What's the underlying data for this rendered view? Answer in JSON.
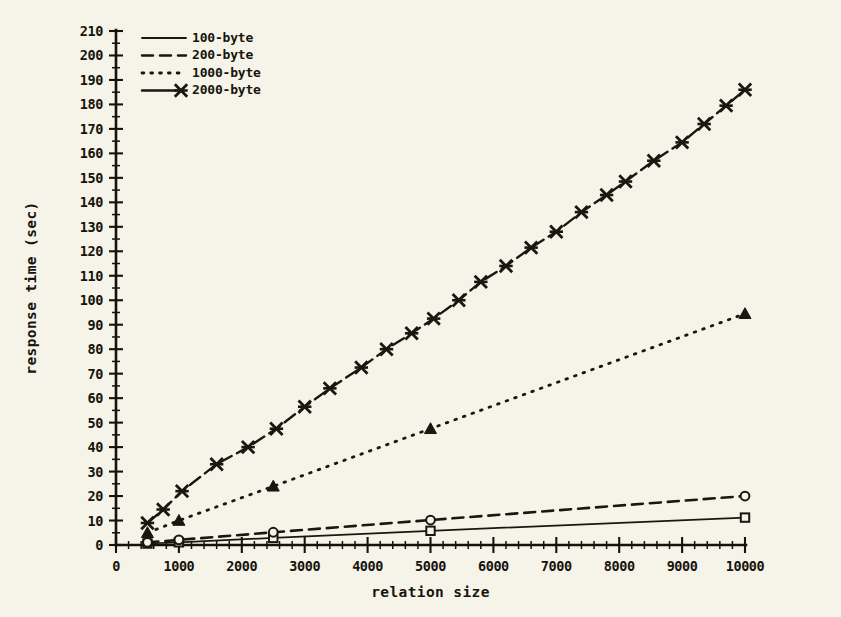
{
  "chart_data": {
    "type": "line",
    "title": "",
    "xlabel": "relation size",
    "ylabel": "response time (sec)",
    "xlim": [
      0,
      10000
    ],
    "ylim": [
      0,
      210
    ],
    "xticks": [
      0,
      1000,
      2000,
      3000,
      4000,
      5000,
      6000,
      7000,
      8000,
      9000,
      10000
    ],
    "yticks": [
      0,
      10,
      20,
      30,
      40,
      50,
      60,
      70,
      80,
      90,
      100,
      110,
      120,
      130,
      140,
      150,
      160,
      170,
      180,
      190,
      200,
      210
    ],
    "xtick_labels": [
      "0",
      "1000",
      "2000",
      "3000",
      "4000",
      "5000",
      "6000",
      "7000",
      "8000",
      "9000",
      "10000"
    ],
    "ytick_labels": [
      "0",
      "10",
      "20",
      "30",
      "40",
      "50",
      "60",
      "70",
      "80",
      "90",
      "100",
      "110",
      "120",
      "130",
      "140",
      "150",
      "160",
      "170",
      "180",
      "190",
      "200",
      "210"
    ],
    "grid": false,
    "legend_position": "top-left",
    "series": [
      {
        "name": "100-byte",
        "label": "100-byte",
        "linestyle": "solid",
        "marker": "square-open",
        "color": "#1a1710",
        "x": [
          500,
          1000,
          2500,
          5000,
          10000
        ],
        "values": [
          0.6,
          1.1,
          2.9,
          5.8,
          11.2
        ]
      },
      {
        "name": "200-byte",
        "label": "200-byte",
        "linestyle": "dashed",
        "marker": "circle-open",
        "color": "#1a1710",
        "x": [
          500,
          1000,
          2500,
          5000,
          10000
        ],
        "values": [
          1.1,
          2.1,
          5.2,
          10.2,
          20.0
        ]
      },
      {
        "name": "1000-byte",
        "label": "1000-byte",
        "linestyle": "dotted",
        "marker": "triangle",
        "color": "#1a1710",
        "x": [
          500,
          1000,
          2500,
          5000,
          10000
        ],
        "values": [
          5.0,
          10.0,
          24.0,
          47.5,
          94.5
        ]
      },
      {
        "name": "2000-byte",
        "label": "2000-byte",
        "linestyle": "dashdot",
        "marker": "cross",
        "color": "#1a1710",
        "x": [
          500,
          750,
          1050,
          1600,
          2100,
          2550,
          3000,
          3400,
          3900,
          4300,
          4700,
          5050,
          5450,
          5800,
          6200,
          6600,
          7000,
          7400,
          7800,
          8100,
          8550,
          9000,
          9350,
          9700,
          10000
        ],
        "values": [
          9.0,
          14.5,
          22.0,
          33.0,
          40.0,
          47.5,
          56.5,
          64.0,
          72.5,
          80.0,
          86.5,
          92.5,
          100.0,
          107.5,
          114.0,
          121.5,
          128.0,
          136.0,
          143.0,
          148.5,
          157.0,
          164.5,
          172.0,
          179.5,
          186.0
        ]
      }
    ]
  },
  "legend": {
    "entries": [
      {
        "label": "100-byte",
        "style": "solid"
      },
      {
        "label": "200-byte",
        "style": "dashed"
      },
      {
        "label": "1000-byte",
        "style": "dotted"
      },
      {
        "label": "2000-byte",
        "style": "dashdot-cross"
      }
    ]
  }
}
